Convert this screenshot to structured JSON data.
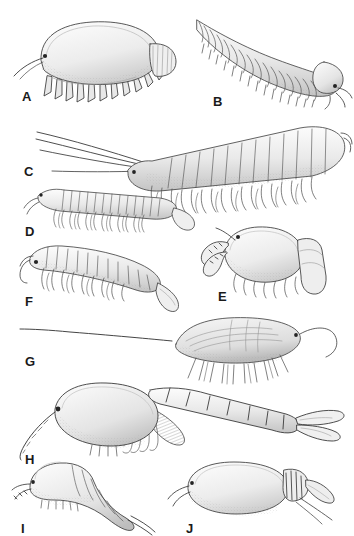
{
  "plate": {
    "title": "Comparative morphology plate of crustacean body plans",
    "background_color": "#ffffff",
    "ink_color": "#2b2b2b",
    "label_color": "#1a1a1a",
    "medium": "pen-and-ink stipple line drawing",
    "palette": {
      "outline": "#3a3a3a",
      "fill_light": "#f2f2f2",
      "fill_mid": "#d8d8d8",
      "shade_dark": "#a9a9a9",
      "hatch": "#8e8e8e"
    }
  },
  "figures": [
    {
      "id": "A",
      "label": "A",
      "label_x": 22,
      "label_y": 90,
      "common_form": "domed oval carapace, lateral view",
      "features": "broad smooth dome, fringe of short legs beneath, single antenna projecting forward-left, posterior plate-like appendage",
      "segment_count": 0,
      "leg_count": 11
    },
    {
      "id": "B",
      "label": "B",
      "label_x": 213,
      "label_y": 95,
      "common_form": "elongate tapering trunk, dorso-lateral view",
      "features": "numerous transverse tergite rings narrowing to a pointed tail at upper left, rounded head capsule at lower right with paired antennae",
      "segment_count": 22,
      "leg_count": 18
    },
    {
      "id": "C",
      "label": "C",
      "label_x": 24,
      "label_y": 165,
      "common_form": "long-antennate multisegmented body, lateral view",
      "features": "two very long sweeping antennae to the left, deep segmented trunk with dense double row of biramous limbs, tail spine at right",
      "segment_count": 16,
      "leg_count": 17
    },
    {
      "id": "D",
      "label": "D",
      "label_x": 25,
      "label_y": 225,
      "common_form": "slender elongate body, lateral view",
      "features": "small head with eye at left, uniform file of narrow tergites, paired slim legs along ventral margin, tapering paddle tail at right",
      "segment_count": 20,
      "leg_count": 20
    },
    {
      "id": "E",
      "label": "E",
      "label_x": 218,
      "label_y": 290,
      "common_form": "rounded carapace with large limbs, lateral view",
      "features": "smooth globular shield, stalked eye at upper left, two jointed raptorial appendages in front, fringe of small legs below, thick segmented limb trailing right",
      "segment_count": 0,
      "leg_count": 9
    },
    {
      "id": "F",
      "label": "F",
      "label_x": 25,
      "label_y": 295,
      "common_form": "centipede-like arched body, lateral view",
      "features": "hooked antenna and dark eye at left, arched row of rectangular tergites, dense paired walking legs, swollen club-shaped tail curving down-right",
      "segment_count": 17,
      "leg_count": 16
    },
    {
      "id": "G",
      "label": "G",
      "label_x": 25,
      "label_y": 355,
      "common_form": "bivalved lens-shaped carapace, lateral view",
      "features": "flattened almond carapace with internal striations, very long straight caudal spine extending far left, curved whip-like antenna at right, splayed setose limbs beneath",
      "segment_count": 0,
      "leg_count": 10
    },
    {
      "id": "H",
      "label": "H",
      "label_x": 25,
      "label_y": 453,
      "common_form": "shrimp-like body with carapace and tail fan, lateral view",
      "features": "large smooth ovoid carapace, stalked eye and long setose antenna at left, hatched gill-like thoracic limbs, six-segmented abdomen extending right to a spreading tail fan",
      "segment_count": 7,
      "leg_count": 8
    },
    {
      "id": "I",
      "label": "I",
      "label_x": 21,
      "label_y": 522,
      "common_form": "curved body with tapering abdomen, lateral view",
      "features": "rounded anterior shield, short frontal appendages, row of fine ventral setae, arched segmented abdomen ending in a slim straight telson",
      "segment_count": 6,
      "leg_count": 12
    },
    {
      "id": "J",
      "label": "J",
      "label_x": 186,
      "label_y": 522,
      "common_form": "broad oval carapace, lateral view",
      "features": "smooth swollen oval shield, small eye and two short antennae at left, cluster of striated posterior appendages and trailing tail filaments at right",
      "segment_count": 0,
      "leg_count": 6
    }
  ]
}
